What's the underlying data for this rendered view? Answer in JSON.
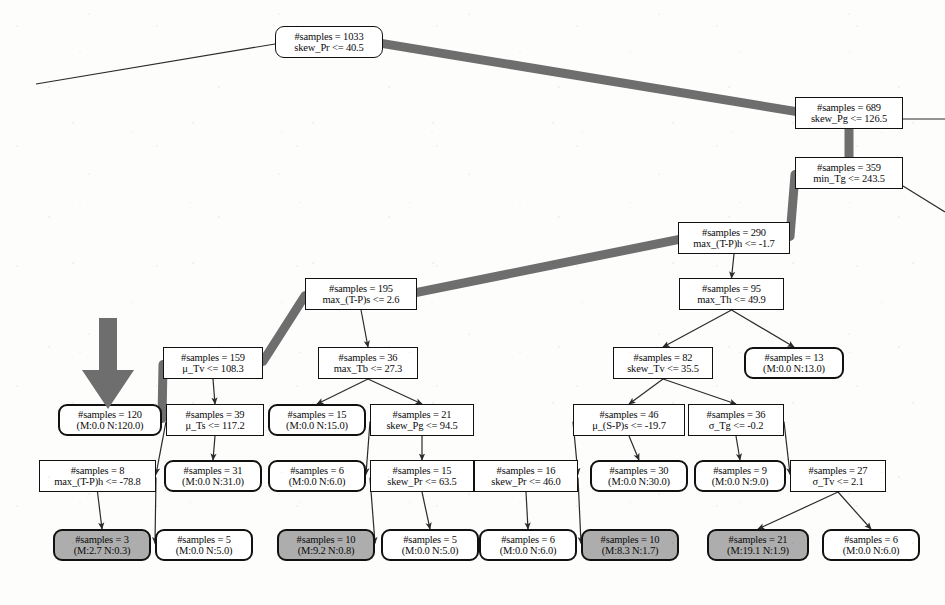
{
  "figure": {
    "kind": "decision-tree",
    "width": 945,
    "height": 605,
    "colors": {
      "node_fill": "#ffffff",
      "shaded_leaf_fill": "#adadad",
      "node_stroke": "#111111",
      "edge_stroke": "#2b2b2b",
      "highlight_path": "#6e6e6e",
      "pointer_arrow": "#6e6e6e"
    }
  },
  "pointer_arrow": {
    "name": "highlight-arrow",
    "points_to_node": "n120",
    "x": 80,
    "y": 318,
    "width": 56,
    "height": 92
  },
  "nodes": [
    {
      "id": "n1033",
      "type": "root",
      "shaded": false,
      "x": 275,
      "y": 26,
      "w": 108,
      "h": 32,
      "l1": "#samples = 1033",
      "l2": "skew_Pr <= 40.5"
    },
    {
      "id": "n689",
      "type": "split",
      "shaded": false,
      "x": 795,
      "y": 97,
      "w": 108,
      "h": 32,
      "l1": "#samples = 689",
      "l2": "skew_Pg <= 126.5"
    },
    {
      "id": "n359",
      "type": "split",
      "shaded": false,
      "x": 795,
      "y": 157,
      "w": 108,
      "h": 32,
      "l1": "#samples = 359",
      "l2": "min_Tg <= 243.5"
    },
    {
      "id": "n290",
      "type": "split",
      "shaded": false,
      "x": 678,
      "y": 222,
      "w": 112,
      "h": 32,
      "l1": "#samples = 290",
      "l2": "max_(T-P)h <= -1.7"
    },
    {
      "id": "n195",
      "type": "split",
      "shaded": false,
      "x": 305,
      "y": 278,
      "w": 112,
      "h": 32,
      "l1": "#samples = 195",
      "l2": "max_(T-P)s <= 2.6"
    },
    {
      "id": "n95",
      "type": "split",
      "shaded": false,
      "x": 679,
      "y": 278,
      "w": 105,
      "h": 32,
      "l1": "#samples = 95",
      "l2": "max_Th <= 49.9"
    },
    {
      "id": "n159",
      "type": "split",
      "shaded": false,
      "x": 163,
      "y": 347,
      "w": 100,
      "h": 32,
      "l1": "#samples = 159",
      "l2": "μ_Tv <= 108.3"
    },
    {
      "id": "n36",
      "type": "split",
      "shaded": false,
      "x": 318,
      "y": 347,
      "w": 100,
      "h": 32,
      "l1": "#samples = 36",
      "l2": "max_Tb <= 27.3"
    },
    {
      "id": "n82",
      "type": "split",
      "shaded": false,
      "x": 613,
      "y": 347,
      "w": 100,
      "h": 32,
      "l1": "#samples = 82",
      "l2": "skew_Tv <= 35.5"
    },
    {
      "id": "n13",
      "type": "leaf",
      "shaded": false,
      "x": 744,
      "y": 347,
      "w": 100,
      "h": 32,
      "l1": "#samples = 13",
      "l2": "(M:0.0 N:13.0)"
    },
    {
      "id": "n120",
      "type": "leaf",
      "shaded": false,
      "x": 58,
      "y": 404,
      "w": 104,
      "h": 32,
      "l1": "#samples = 120",
      "l2": "(M:0.0 N:120.0)"
    },
    {
      "id": "n39",
      "type": "split",
      "shaded": false,
      "x": 166,
      "y": 404,
      "w": 98,
      "h": 32,
      "l1": "#samples = 39",
      "l2": "μ_Ts <= 117.2"
    },
    {
      "id": "n15a",
      "type": "leaf",
      "shaded": false,
      "x": 268,
      "y": 404,
      "w": 98,
      "h": 32,
      "l1": "#samples = 15",
      "l2": "(M:0.0 N:15.0)"
    },
    {
      "id": "n21",
      "type": "split",
      "shaded": false,
      "x": 370,
      "y": 404,
      "w": 104,
      "h": 32,
      "l1": "#samples = 21",
      "l2": "skew_Pg <= 94.5"
    },
    {
      "id": "n46",
      "type": "split",
      "shaded": false,
      "x": 573,
      "y": 404,
      "w": 112,
      "h": 32,
      "l1": "#samples = 46",
      "l2": "μ_(S-P)s <= -19.7"
    },
    {
      "id": "n36b",
      "type": "split",
      "shaded": false,
      "x": 688,
      "y": 404,
      "w": 96,
      "h": 32,
      "l1": "#samples = 36",
      "l2": "σ_Tg <= -0.2"
    },
    {
      "id": "n8",
      "type": "split",
      "shaded": false,
      "x": 39,
      "y": 460,
      "w": 117,
      "h": 32,
      "l1": "#samples = 8",
      "l2": "max_(T-P)h <= -78.8"
    },
    {
      "id": "n31",
      "type": "leaf",
      "shaded": false,
      "x": 164,
      "y": 460,
      "w": 98,
      "h": 32,
      "l1": "#samples = 31",
      "l2": "(M:0.0 N:31.0)"
    },
    {
      "id": "n6a",
      "type": "leaf",
      "shaded": false,
      "x": 268,
      "y": 460,
      "w": 98,
      "h": 32,
      "l1": "#samples = 6",
      "l2": "(M:0.0 N:6.0)"
    },
    {
      "id": "n15b",
      "type": "split",
      "shaded": false,
      "x": 370,
      "y": 460,
      "w": 104,
      "h": 32,
      "l1": "#samples = 15",
      "l2": "skew_Pr <= 63.5"
    },
    {
      "id": "n16",
      "type": "split",
      "shaded": false,
      "x": 474,
      "y": 460,
      "w": 104,
      "h": 32,
      "l1": "#samples = 16",
      "l2": "skew_Pr <= 46.0"
    },
    {
      "id": "n30",
      "type": "leaf",
      "shaded": false,
      "x": 590,
      "y": 460,
      "w": 98,
      "h": 32,
      "l1": "#samples = 30",
      "l2": "(M:0.0 N:30.0)"
    },
    {
      "id": "n9",
      "type": "leaf",
      "shaded": false,
      "x": 694,
      "y": 460,
      "w": 92,
      "h": 32,
      "l1": "#samples = 9",
      "l2": "(M:0.0 N:9.0)"
    },
    {
      "id": "n27",
      "type": "split",
      "shaded": false,
      "x": 790,
      "y": 460,
      "w": 96,
      "h": 32,
      "l1": "#samples = 27",
      "l2": "σ_Tv <= 2.1"
    },
    {
      "id": "n3",
      "type": "leaf",
      "shaded": true,
      "x": 53,
      "y": 529,
      "w": 98,
      "h": 32,
      "l1": "#samples = 3",
      "l2": "(M:2.7 N:0.3)"
    },
    {
      "id": "n5a",
      "type": "leaf",
      "shaded": false,
      "x": 155,
      "y": 529,
      "w": 98,
      "h": 32,
      "l1": "#samples = 5",
      "l2": "(M:0.0 N:5.0)"
    },
    {
      "id": "n10a",
      "type": "leaf",
      "shaded": true,
      "x": 277,
      "y": 529,
      "w": 98,
      "h": 32,
      "l1": "#samples = 10",
      "l2": "(M:9.2 N:0.8)"
    },
    {
      "id": "n5b",
      "type": "leaf",
      "shaded": false,
      "x": 381,
      "y": 529,
      "w": 98,
      "h": 32,
      "l1": "#samples = 5",
      "l2": "(M:0.0 N:5.0)"
    },
    {
      "id": "n6b",
      "type": "leaf",
      "shaded": false,
      "x": 479,
      "y": 529,
      "w": 98,
      "h": 32,
      "l1": "#samples = 6",
      "l2": "(M:0.0 N:6.0)"
    },
    {
      "id": "n10b",
      "type": "leaf",
      "shaded": true,
      "x": 581,
      "y": 529,
      "w": 98,
      "h": 32,
      "l1": "#samples = 10",
      "l2": "(M:8.3 N:1.7)"
    },
    {
      "id": "n21b",
      "type": "leaf",
      "shaded": true,
      "x": 707,
      "y": 529,
      "w": 102,
      "h": 32,
      "l1": "#samples = 21",
      "l2": "(M:19.1 N:1.9)"
    },
    {
      "id": "n6c",
      "type": "leaf",
      "shaded": false,
      "x": 822,
      "y": 529,
      "w": 98,
      "h": 32,
      "l1": "#samples = 6",
      "l2": "(M:0.0 N:6.0)"
    }
  ],
  "edges": [
    {
      "from": "n1033",
      "to": "n689",
      "highlight": true,
      "arrow": false
    },
    {
      "from": "n689",
      "to": "n359",
      "highlight": true,
      "arrow": false
    },
    {
      "from": "n359",
      "to": "n290",
      "highlight": true,
      "arrow": false
    },
    {
      "from": "n290",
      "to": "n195",
      "highlight": true,
      "arrow": false
    },
    {
      "from": "n290",
      "to": "n95",
      "highlight": false,
      "arrow": true
    },
    {
      "from": "n195",
      "to": "n159",
      "highlight": true,
      "arrow": false
    },
    {
      "from": "n195",
      "to": "n36",
      "highlight": false,
      "arrow": true
    },
    {
      "from": "n159",
      "to": "n120",
      "highlight": true,
      "arrow": false
    },
    {
      "from": "n159",
      "to": "n39",
      "highlight": false,
      "arrow": true
    },
    {
      "from": "n36",
      "to": "n15a",
      "highlight": false,
      "arrow": true
    },
    {
      "from": "n36",
      "to": "n21",
      "highlight": false,
      "arrow": true
    },
    {
      "from": "n95",
      "to": "n82",
      "highlight": false,
      "arrow": true
    },
    {
      "from": "n95",
      "to": "n13",
      "highlight": false,
      "arrow": true
    },
    {
      "from": "n39",
      "to": "n8",
      "highlight": false,
      "arrow": true
    },
    {
      "from": "n39",
      "to": "n31",
      "highlight": false,
      "arrow": true
    },
    {
      "from": "n21",
      "to": "n6a",
      "highlight": false,
      "arrow": true
    },
    {
      "from": "n21",
      "to": "n15b",
      "highlight": false,
      "arrow": true
    },
    {
      "from": "n82",
      "to": "n46",
      "highlight": false,
      "arrow": true
    },
    {
      "from": "n82",
      "to": "n36b",
      "highlight": false,
      "arrow": true
    },
    {
      "from": "n46",
      "to": "n16",
      "highlight": false,
      "arrow": true
    },
    {
      "from": "n46",
      "to": "n30",
      "highlight": false,
      "arrow": true
    },
    {
      "from": "n36b",
      "to": "n9",
      "highlight": false,
      "arrow": true
    },
    {
      "from": "n36b",
      "to": "n27",
      "highlight": false,
      "arrow": true
    },
    {
      "from": "n8",
      "to": "n3",
      "highlight": false,
      "arrow": true
    },
    {
      "from": "n8",
      "to": "n5a",
      "highlight": false,
      "arrow": true
    },
    {
      "from": "n15b",
      "to": "n10a",
      "highlight": false,
      "arrow": true
    },
    {
      "from": "n15b",
      "to": "n5b",
      "highlight": false,
      "arrow": true
    },
    {
      "from": "n16",
      "to": "n6b",
      "highlight": false,
      "arrow": true
    },
    {
      "from": "n16",
      "to": "n10b",
      "highlight": false,
      "arrow": true
    },
    {
      "from": "n27",
      "to": "n21b",
      "highlight": false,
      "arrow": true
    },
    {
      "from": "n27",
      "to": "n6c",
      "highlight": false,
      "arrow": true
    }
  ],
  "stub_edges": [
    {
      "name": "root-left-truncated-branch",
      "x1": 275,
      "y1": 44,
      "x2": 36,
      "y2": 84
    },
    {
      "name": "n689-right-truncated-branch",
      "x1": 903,
      "y1": 119,
      "x2": 945,
      "y2": 119
    },
    {
      "name": "n359-right-truncated-branch",
      "x1": 903,
      "y1": 186,
      "x2": 945,
      "y2": 212
    }
  ]
}
